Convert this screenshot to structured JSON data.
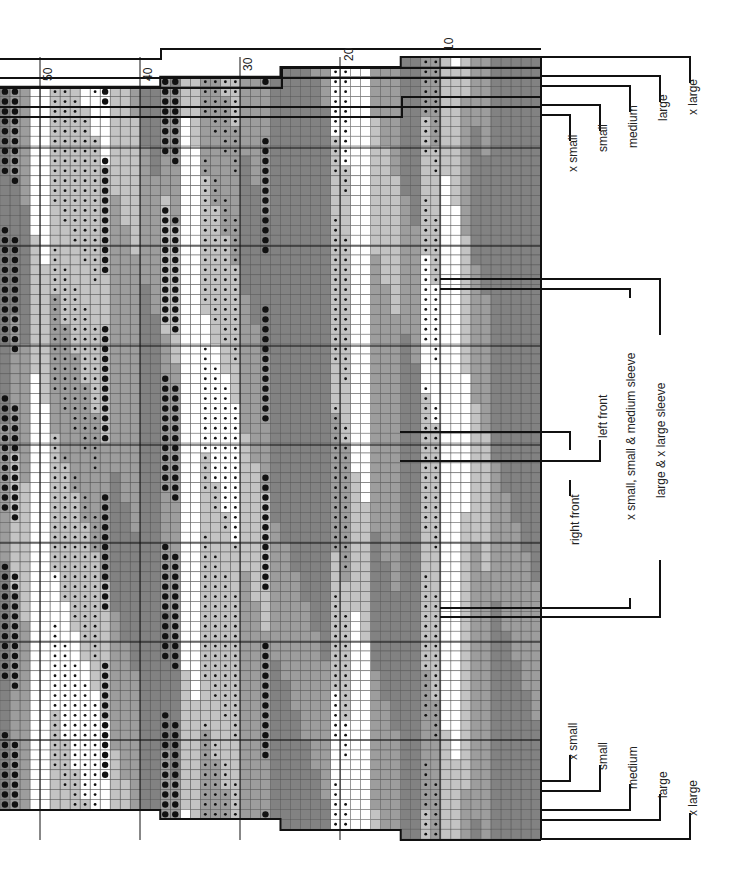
{
  "chart_title": "",
  "colors": {
    "dark": "#828282",
    "medium": "#9d9d9d",
    "light": "#c3c3c3",
    "white": "#ffffff",
    "gridline": "#555555",
    "border": "#111111",
    "dot": "#111111"
  },
  "grid": {
    "columns": 54,
    "cell_w": 10.02,
    "cell_h": 9.9,
    "right_edge_x": 541,
    "top_y": 57,
    "rows": 79
  },
  "column_numbers": [
    {
      "col": 10,
      "label": "10"
    },
    {
      "col": 20,
      "label": "20"
    },
    {
      "col": 30,
      "label": "30"
    },
    {
      "col": 40,
      "label": "40"
    },
    {
      "col": 50,
      "label": "50"
    }
  ],
  "top_steps": [
    {
      "from_col": 1,
      "to_col": 14,
      "offset_rows": 0
    },
    {
      "from_col": 15,
      "to_col": 26,
      "offset_rows": 1
    },
    {
      "from_col": 27,
      "to_col": 38,
      "offset_rows": 2
    },
    {
      "from_col": 39,
      "to_col": 54,
      "offset_rows": 3
    }
  ],
  "bottom_steps": [
    {
      "from_col": 1,
      "to_col": 14,
      "end_y": 840
    },
    {
      "from_col": 15,
      "to_col": 26,
      "end_y": 830
    },
    {
      "from_col": 27,
      "to_col": 38,
      "end_y": 819
    },
    {
      "from_col": 39,
      "to_col": 54,
      "end_y": 810
    }
  ],
  "size_labels_top": [
    {
      "label": "x small",
      "x": 566,
      "y": 172,
      "bracket_y": 115,
      "bracket_x": 570
    },
    {
      "label": "small",
      "x": 596,
      "y": 152,
      "bracket_y": 105,
      "bracket_x": 600
    },
    {
      "label": "medium",
      "x": 626,
      "y": 148,
      "bracket_y": 86,
      "bracket_x": 630
    },
    {
      "label": "large",
      "x": 656,
      "y": 121,
      "bracket_y": 76,
      "bracket_x": 660
    },
    {
      "label": "x large",
      "x": 686,
      "y": 115,
      "bracket_y": 57,
      "bracket_x": 690
    }
  ],
  "size_labels_bottom": [
    {
      "label": "x small",
      "x": 566,
      "y": 760,
      "bracket_y": 781,
      "bracket_x": 570
    },
    {
      "label": "small",
      "x": 596,
      "y": 770,
      "bracket_y": 791,
      "bracket_x": 600
    },
    {
      "label": "medium",
      "x": 626,
      "y": 789,
      "bracket_y": 810,
      "bracket_x": 630
    },
    {
      "label": "large",
      "x": 656,
      "y": 798,
      "bracket_y": 820,
      "bracket_x": 660
    },
    {
      "label": "x large",
      "x": 686,
      "y": 816,
      "bracket_y": 839,
      "bracket_x": 690
    }
  ],
  "piece_labels": [
    {
      "label": "left front",
      "x": 596,
      "y": 438
    },
    {
      "label": "right front",
      "x": 568,
      "y": 545
    },
    {
      "label": "x small, small & medium sleeve",
      "x": 624,
      "y": 520
    },
    {
      "label": "large & x large sleeve",
      "x": 654,
      "y": 498
    }
  ],
  "piece_brackets": [
    {
      "name": "left-front-bracket",
      "y1": 432,
      "y2": 432,
      "x": 570,
      "from_y": 432,
      "to_y": 450,
      "kind": "top"
    },
    {
      "name": "left-front-bracket-2",
      "y1": 461,
      "x": 600,
      "from_y": 440,
      "to_y": 461,
      "kind": "bottom"
    },
    {
      "name": "right-front-tick",
      "x": 570,
      "from_y": 480,
      "to_y": 496,
      "kind": "tick"
    },
    {
      "name": "xs-s-m-sleeve-top",
      "y": 289,
      "x": 630,
      "from_y": 289,
      "to_y": 298,
      "kind": "top"
    },
    {
      "name": "xs-s-m-sleeve-bottom",
      "y": 608,
      "x": 630,
      "from_y": 598,
      "to_y": 608,
      "kind": "bottom"
    },
    {
      "name": "l-xl-sleeve-top",
      "y": 279,
      "x": 660,
      "from_y": 279,
      "to_y": 335,
      "kind": "top"
    },
    {
      "name": "l-xl-sleeve-bottom",
      "y": 617,
      "x": 660,
      "from_y": 560,
      "to_y": 617,
      "kind": "bottom"
    }
  ],
  "section_lines_y": [
    148,
    246,
    346,
    445,
    543,
    642,
    740
  ],
  "section_lines_x": [
    40,
    140,
    240,
    340,
    440
  ],
  "bands": [
    {
      "cols": [
        1,
        5
      ],
      "shade": "dark"
    },
    {
      "cols": [
        6,
        7
      ],
      "shade": "medium"
    },
    {
      "cols": [
        8,
        8
      ],
      "shade": "light"
    },
    {
      "cols": [
        9,
        10
      ],
      "shade": "white"
    },
    {
      "cols": [
        11,
        11
      ],
      "shade": "light",
      "dots": "small"
    },
    {
      "cols": [
        12,
        12
      ],
      "shade": "light",
      "dots": "small"
    },
    {
      "cols": [
        13,
        14
      ],
      "shade": "dark"
    },
    {
      "cols": [
        15,
        17
      ],
      "shade": "medium"
    },
    {
      "cols": [
        18,
        19
      ],
      "shade": "white"
    },
    {
      "cols": [
        20,
        21
      ],
      "shade": "light",
      "dots": "small"
    },
    {
      "cols": [
        22,
        26
      ],
      "shade": "dark"
    },
    {
      "cols": [
        27,
        27
      ],
      "shade": "dark"
    },
    {
      "cols": [
        28,
        28
      ],
      "shade": "medium",
      "dots": "large"
    },
    {
      "cols": [
        29,
        30
      ],
      "shade": "medium"
    },
    {
      "cols": [
        31,
        34
      ],
      "shade": "light",
      "dots": "small"
    },
    {
      "cols": [
        35,
        36
      ],
      "shade": "white"
    },
    {
      "cols": [
        37,
        37
      ],
      "shade": "medium",
      "dots": "large"
    },
    {
      "cols": [
        38,
        38
      ],
      "shade": "medium",
      "dots": "large"
    },
    {
      "cols": [
        39,
        40
      ],
      "shade": "dark"
    },
    {
      "cols": [
        41,
        43
      ],
      "shade": "medium"
    },
    {
      "cols": [
        44,
        44
      ],
      "shade": "light",
      "dots": "large"
    },
    {
      "cols": [
        45,
        46
      ],
      "shade": "light",
      "dots": "small"
    },
    {
      "cols": [
        47,
        49
      ],
      "shade": "light",
      "dots": "small"
    },
    {
      "cols": [
        50,
        51
      ],
      "shade": "white"
    },
    {
      "cols": [
        52,
        52
      ],
      "shade": "medium"
    },
    {
      "cols": [
        53,
        53
      ],
      "shade": "medium",
      "dots": "large"
    },
    {
      "cols": [
        54,
        54
      ],
      "shade": "dark",
      "dots": "large"
    }
  ]
}
